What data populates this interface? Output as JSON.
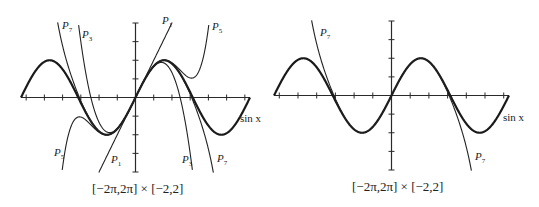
{
  "chart_data": [
    {
      "type": "line",
      "title": "",
      "caption": "[−2π,2π] × [−2,2]",
      "xlim": [
        -6.2832,
        6.2832
      ],
      "ylim": [
        -2,
        2
      ],
      "x_ticks_spacing": 1,
      "y_ticks_spacing": 0.5,
      "grid": false,
      "series": [
        {
          "name": "sin x",
          "label": "sin x",
          "expr": "sin(x)",
          "bold": true
        },
        {
          "name": "P1",
          "label": "P₁",
          "expr": "x"
        },
        {
          "name": "P3",
          "label": "P₃",
          "expr": "x - x^3/6"
        },
        {
          "name": "P5",
          "label": "P₅",
          "expr": "x - x^3/6 + x^5/120"
        },
        {
          "name": "P7",
          "label": "P₇",
          "expr": "x - x^3/6 + x^5/120 - x^7/5040"
        }
      ]
    },
    {
      "type": "line",
      "title": "",
      "caption": "[−2π,2π] × [−2,2]",
      "xlim": [
        -6.2832,
        6.2832
      ],
      "ylim": [
        -2,
        2
      ],
      "x_ticks_spacing": 1,
      "y_ticks_spacing": 0.5,
      "grid": false,
      "series": [
        {
          "name": "sin x",
          "label": "sin x",
          "expr": "sin(x)",
          "bold": true
        },
        {
          "name": "P7",
          "label": "P₇",
          "expr": "x - x^3/6 + x^5/120 - x^7/5040"
        }
      ]
    }
  ],
  "labels": {
    "left": {
      "p7": "P",
      "p7_sub": "7",
      "p3": "P",
      "p3_sub": "3",
      "p1": "P",
      "p1_sub": "1",
      "p5": "P",
      "p5_sub": "5",
      "sin": "sin x"
    },
    "right": {
      "p7": "P",
      "p7_sub": "7",
      "sin": "sin x"
    }
  },
  "captions": {
    "left": "[−2π,2π] × [−2,2]",
    "right": "[−2π,2π] × [−2,2]"
  }
}
